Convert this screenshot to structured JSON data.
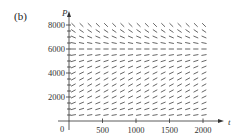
{
  "panel_label": "(b)",
  "chart_data": {
    "type": "slope_field",
    "title": "",
    "xlabel": "t",
    "ylabel": "P",
    "xlim": [
      0,
      2100
    ],
    "ylim": [
      0,
      8500
    ],
    "x_ticks": [
      500,
      1000,
      1500,
      2000
    ],
    "x_tick_labels": [
      "500",
      "1000",
      "1500",
      "2000"
    ],
    "y_ticks": [
      2000,
      4000,
      6000,
      8000
    ],
    "y_tick_labels": [
      "2000",
      "4000",
      "6000",
      "8000"
    ],
    "origin_label": "0",
    "grid": false,
    "field": {
      "t_start": 50,
      "t_end": 2000,
      "t_count": 17,
      "P_start": 500,
      "P_end": 8000,
      "P_step": 500,
      "equilibrium_P": 6000,
      "description": "Logistic-type direction field: slopes positive below ~6000, zero near 6000, negative above"
    }
  },
  "colors": {
    "ink": "#333333",
    "background": "#ffffff"
  }
}
